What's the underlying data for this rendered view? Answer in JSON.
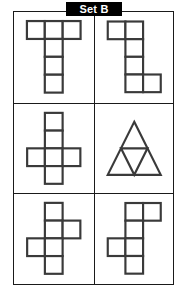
{
  "page": {
    "title": "Set B",
    "background_color": "#ffffff",
    "line_color": "#3a3a3a",
    "frame_color": "#1a1a1a",
    "banner_background": "#000000",
    "banner_text_color": "#ffffff"
  },
  "grid": {
    "columns": 2,
    "rows": 3,
    "cells": [
      {
        "id": "cell-1",
        "position": "top-left",
        "figure_type": "polyomino",
        "square_count": 6,
        "description": "T-shape: top row of three squares with a column of three squares descending from the centre square",
        "cells": [
          [
            0,
            0
          ],
          [
            1,
            0
          ],
          [
            2,
            0
          ],
          [
            1,
            1
          ],
          [
            1,
            2
          ],
          [
            1,
            3
          ]
        ]
      },
      {
        "id": "cell-2",
        "position": "top-right",
        "figure_type": "polyomino",
        "square_count": 6,
        "description": "Z/S-shape: top row of two squares, a vertical column of three, and a bottom row of two offset to the right",
        "cells": [
          [
            0,
            0
          ],
          [
            1,
            0
          ],
          [
            1,
            1
          ],
          [
            1,
            2
          ],
          [
            1,
            3
          ],
          [
            2,
            3
          ]
        ]
      },
      {
        "id": "cell-3",
        "position": "middle-left",
        "figure_type": "polyomino",
        "square_count": 6,
        "description": "Cross-shaped cube net: vertical column of four squares with one square to the left and one to the right of the third square",
        "cells": [
          [
            1,
            0
          ],
          [
            1,
            1
          ],
          [
            0,
            2
          ],
          [
            1,
            2
          ],
          [
            2,
            2
          ],
          [
            1,
            3
          ]
        ]
      },
      {
        "id": "cell-4",
        "position": "middle-right",
        "figure_type": "triangle-subdivision",
        "triangle_count": 4,
        "description": "Large equilateral triangle subdivided by midlines into four smaller equilateral triangles"
      },
      {
        "id": "cell-5",
        "position": "bottom-left",
        "figure_type": "polyomino",
        "square_count": 6,
        "description": "Cube net: vertical column of four squares with one square to the right of the second square and one square to the left of the third square",
        "cells": [
          [
            1,
            0
          ],
          [
            1,
            1
          ],
          [
            2,
            1
          ],
          [
            0,
            2
          ],
          [
            1,
            2
          ],
          [
            1,
            3
          ]
        ]
      },
      {
        "id": "cell-6",
        "position": "bottom-right",
        "figure_type": "polyomino",
        "square_count": 6,
        "description": "Cube net: vertical column of four squares with one square to the right of the first square and one square to the left of the third square",
        "cells": [
          [
            1,
            0
          ],
          [
            2,
            0
          ],
          [
            1,
            1
          ],
          [
            0,
            2
          ],
          [
            1,
            2
          ],
          [
            1,
            3
          ]
        ]
      }
    ]
  }
}
